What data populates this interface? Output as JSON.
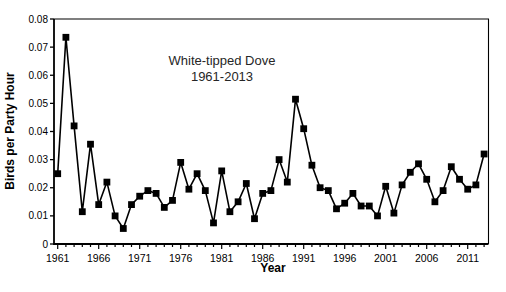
{
  "figure": {
    "title_line1": "White-tipped Dove",
    "title_line2": "1961-2013"
  },
  "chart_data": {
    "type": "line",
    "title": "White-tipped Dove 1961-2013",
    "xlabel": "Year",
    "ylabel": "Birds per Party Hour",
    "marker": "square",
    "line_color": "#000000",
    "marker_color": "#000000",
    "grid": false,
    "legend": "none",
    "ylim": [
      0,
      0.08
    ],
    "ytick_step": 0.01,
    "y_tick_labels": [
      "0",
      "0.01",
      "0.02",
      "0.03",
      "0.04",
      "0.05",
      "0.06",
      "0.07",
      "0.08"
    ],
    "x_ticks_labeled": [
      1961,
      1966,
      1971,
      1976,
      1981,
      1986,
      1991,
      1996,
      2001,
      2006,
      2011
    ],
    "x": [
      1961,
      1962,
      1963,
      1964,
      1965,
      1966,
      1967,
      1968,
      1969,
      1970,
      1971,
      1972,
      1973,
      1974,
      1975,
      1976,
      1977,
      1978,
      1979,
      1980,
      1981,
      1982,
      1983,
      1984,
      1985,
      1986,
      1987,
      1988,
      1989,
      1990,
      1991,
      1992,
      1993,
      1994,
      1995,
      1996,
      1997,
      1998,
      1999,
      2000,
      2001,
      2002,
      2003,
      2004,
      2005,
      2006,
      2007,
      2008,
      2009,
      2010,
      2011,
      2012,
      2013
    ],
    "values": [
      0.025,
      0.0735,
      0.042,
      0.0115,
      0.0355,
      0.014,
      0.022,
      0.01,
      0.0055,
      0.014,
      0.017,
      0.019,
      0.018,
      0.013,
      0.0155,
      0.029,
      0.0195,
      0.025,
      0.019,
      0.0075,
      0.026,
      0.0115,
      0.015,
      0.0215,
      0.009,
      0.018,
      0.019,
      0.03,
      0.022,
      0.0515,
      0.041,
      0.028,
      0.02,
      0.019,
      0.0125,
      0.0145,
      0.018,
      0.0135,
      0.0135,
      0.01,
      0.0205,
      0.011,
      0.021,
      0.0255,
      0.0285,
      0.023,
      0.015,
      0.019,
      0.0275,
      0.023,
      0.0195,
      0.021,
      0.032
    ]
  }
}
